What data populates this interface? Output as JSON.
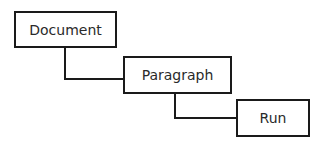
{
  "diagram": {
    "type": "hierarchy",
    "nodes": [
      {
        "id": "document",
        "label": "Document"
      },
      {
        "id": "paragraph",
        "label": "Paragraph"
      },
      {
        "id": "run",
        "label": "Run"
      }
    ],
    "edges": [
      {
        "from": "document",
        "to": "paragraph"
      },
      {
        "from": "paragraph",
        "to": "run"
      }
    ],
    "colors": {
      "stroke": "#1a1a1a",
      "text": "#2a2a2a",
      "background": "#ffffff"
    }
  }
}
